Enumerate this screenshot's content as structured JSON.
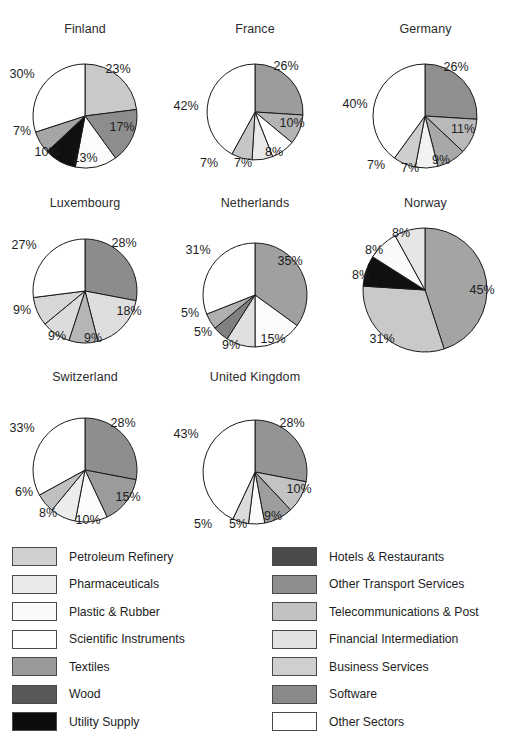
{
  "chart_data": {
    "type": "pie",
    "title": "",
    "subtitle": "",
    "xlabel": "",
    "ylabel": "",
    "legend_position": "bottom",
    "grid": false,
    "value_unit": "%",
    "categories": [
      "Petroleum Refinery",
      "Pharmaceuticals",
      "Plastic & Rubber",
      "Scientific Instruments",
      "Textiles",
      "Wood",
      "Utility Supply",
      "Hotels & Restaurants",
      "Other Transport Services",
      "Telecommunications & Post",
      "Financial Intermediation",
      "Business Services",
      "Software",
      "Other Sectors"
    ],
    "category_colors": [
      "#d0d0d0",
      "#e8e8e8",
      "#fafafa",
      "#ffffff",
      "#9a9a9a",
      "#585858",
      "#0d0d0d",
      "#4a4a4a",
      "#8e8e8e",
      "#c2c2c2",
      "#e2e2e2",
      "#cfcfcf",
      "#8a8a8a",
      "#ffffff"
    ],
    "panels": [
      {
        "name": "Finland",
        "radius": 52,
        "slices": [
          {
            "label": "23%",
            "value": 23,
            "color": "#c9c9c9",
            "label_x": 118,
            "label_y": 69
          },
          {
            "label": "17%",
            "value": 17,
            "color": "#8d8d8d",
            "label_x": 122,
            "label_y": 127
          },
          {
            "label": "13%",
            "value": 13,
            "color": "#fbfbfb",
            "label_x": 85,
            "label_y": 158
          },
          {
            "label": "10%",
            "value": 10,
            "color": "#101010",
            "label_x": 47,
            "label_y": 152
          },
          {
            "label": "7%",
            "value": 7,
            "color": "#a5a5a5",
            "label_x": 22,
            "label_y": 131
          },
          {
            "label": "30%",
            "value": 30,
            "color": "#ffffff",
            "label_x": 22,
            "label_y": 74
          }
        ]
      },
      {
        "name": "France",
        "radius": 48,
        "slices": [
          {
            "label": "26%",
            "value": 26,
            "color": "#9c9c9c",
            "label_x": 286,
            "label_y": 66
          },
          {
            "label": "10%",
            "value": 10,
            "color": "#b4b4b4",
            "label_x": 292,
            "label_y": 123
          },
          {
            "label": "8%",
            "value": 8,
            "color": "#ffffff",
            "label_x": 274,
            "label_y": 152
          },
          {
            "label": "7%",
            "value": 7,
            "color": "#e9e9e9",
            "label_x": 243,
            "label_y": 163
          },
          {
            "label": "7%",
            "value": 7,
            "color": "#c6c6c6",
            "label_x": 209,
            "label_y": 163
          },
          {
            "label": "42%",
            "value": 42,
            "color": "#ffffff",
            "label_x": 186,
            "label_y": 106
          }
        ]
      },
      {
        "name": "Germany",
        "radius": 52,
        "slices": [
          {
            "label": "26%",
            "value": 26,
            "color": "#8f8f8f",
            "label_x": 456,
            "label_y": 67
          },
          {
            "label": "11%",
            "value": 11,
            "color": "#b9b9b9",
            "label_x": 463,
            "label_y": 129
          },
          {
            "label": "9%",
            "value": 9,
            "color": "#a8a8a8",
            "label_x": 441,
            "label_y": 160
          },
          {
            "label": "7%",
            "value": 7,
            "color": "#f2f2f2",
            "label_x": 410,
            "label_y": 168
          },
          {
            "label": "7%",
            "value": 7,
            "color": "#cecece",
            "label_x": 376,
            "label_y": 165
          },
          {
            "label": "40%",
            "value": 40,
            "color": "#ffffff",
            "label_x": 355,
            "label_y": 104
          }
        ]
      },
      {
        "name": "Luxembourg",
        "radius": 52,
        "slices": [
          {
            "label": "28%",
            "value": 28,
            "color": "#8c8c8c",
            "label_x": 124,
            "label_y": 243
          },
          {
            "label": "18%",
            "value": 18,
            "color": "#dedede",
            "label_x": 129,
            "label_y": 311
          },
          {
            "label": "9%",
            "value": 9,
            "color": "#b6b6b6",
            "label_x": 93,
            "label_y": 338
          },
          {
            "label": "9%",
            "value": 9,
            "color": "#dcdcdc",
            "label_x": 57,
            "label_y": 336
          },
          {
            "label": "9%",
            "value": 9,
            "color": "#d7d7d7",
            "label_x": 22,
            "label_y": 310
          },
          {
            "label": "27%",
            "value": 27,
            "color": "#ffffff",
            "label_x": 24,
            "label_y": 245
          }
        ]
      },
      {
        "name": "Netherlands",
        "radius": 52,
        "slices": [
          {
            "label": "35%",
            "value": 35,
            "color": "#a0a0a0",
            "label_x": 290,
            "label_y": 261
          },
          {
            "label": "15%",
            "value": 15,
            "color": "#fbfbfb",
            "label_x": 273,
            "label_y": 339
          },
          {
            "label": "9%",
            "value": 9,
            "color": "#e0e0e0",
            "label_x": 231,
            "label_y": 345
          },
          {
            "label": "5%",
            "value": 5,
            "color": "#808080",
            "label_x": 203,
            "label_y": 332
          },
          {
            "label": "5%",
            "value": 5,
            "color": "#b0b0b0",
            "label_x": 190,
            "label_y": 313
          },
          {
            "label": "31%",
            "value": 31,
            "color": "#ffffff",
            "label_x": 198,
            "label_y": 250
          }
        ]
      },
      {
        "name": "Norway",
        "radius": 62,
        "slices": [
          {
            "label": "45%",
            "value": 45,
            "color": "#a4a4a4",
            "label_x": 482,
            "label_y": 290
          },
          {
            "label": "31%",
            "value": 31,
            "color": "#c9c9c9",
            "label_x": 382,
            "label_y": 339
          },
          {
            "label": "8%",
            "value": 8,
            "color": "#101010",
            "label_x": 361,
            "label_y": 275
          },
          {
            "label": "8%",
            "value": 8,
            "color": "#fafafa",
            "label_x": 374,
            "label_y": 250
          },
          {
            "label": "8%",
            "value": 8,
            "color": "#e6e6e6",
            "label_x": 401,
            "label_y": 233
          }
        ]
      },
      {
        "name": "Switzerland",
        "radius": 52,
        "slices": [
          {
            "label": "28%",
            "value": 28,
            "color": "#8e8e8e",
            "label_x": 123,
            "label_y": 423
          },
          {
            "label": "15%",
            "value": 15,
            "color": "#9b9b9b",
            "label_x": 128,
            "label_y": 497
          },
          {
            "label": "10%",
            "value": 10,
            "color": "#fcfcfc",
            "label_x": 88,
            "label_y": 520
          },
          {
            "label": "8%",
            "value": 8,
            "color": "#ececec",
            "label_x": 48,
            "label_y": 513
          },
          {
            "label": "6%",
            "value": 6,
            "color": "#c0c0c0",
            "label_x": 24,
            "label_y": 492
          },
          {
            "label": "33%",
            "value": 33,
            "color": "#ffffff",
            "label_x": 22,
            "label_y": 428
          }
        ]
      },
      {
        "name": "United Kingdom",
        "radius": 52,
        "slices": [
          {
            "label": "28%",
            "value": 28,
            "color": "#949494",
            "label_x": 292,
            "label_y": 423
          },
          {
            "label": "10%",
            "value": 10,
            "color": "#c3c3c3",
            "label_x": 299,
            "label_y": 489
          },
          {
            "label": "9%",
            "value": 9,
            "color": "#9d9d9d",
            "label_x": 273,
            "label_y": 516
          },
          {
            "label": "5%",
            "value": 5,
            "color": "#fbfbfb",
            "label_x": 238,
            "label_y": 524
          },
          {
            "label": "5%",
            "value": 5,
            "color": "#dcdcdc",
            "label_x": 203,
            "label_y": 524
          },
          {
            "label": "43%",
            "value": 43,
            "color": "#ffffff",
            "label_x": 186,
            "label_y": 434
          }
        ]
      }
    ]
  },
  "legend": {
    "left_column": [
      {
        "label": "Petroleum Refinery",
        "color": "#d0d0d0"
      },
      {
        "label": "Pharmaceuticals",
        "color": "#e9e9e9"
      },
      {
        "label": "Plastic & Rubber",
        "color": "#fafafa"
      },
      {
        "label": "Scientific Instruments",
        "color": "#ffffff"
      },
      {
        "label": "Textiles",
        "color": "#9a9a9a"
      },
      {
        "label": "Wood",
        "color": "#585858"
      },
      {
        "label": "Utility Supply",
        "color": "#0d0d0d"
      }
    ],
    "right_column": [
      {
        "label": "Hotels & Restaurants",
        "color": "#4a4a4a"
      },
      {
        "label": "Other Transport Services",
        "color": "#8e8e8e"
      },
      {
        "label": "Telecommunications & Post",
        "color": "#c2c2c2"
      },
      {
        "label": "Financial Intermediation",
        "color": "#e2e2e2"
      },
      {
        "label": "Business Services",
        "color": "#cfcfcf"
      },
      {
        "label": "Software",
        "color": "#8a8a8a"
      },
      {
        "label": "Other Sectors",
        "color": "#ffffff"
      }
    ]
  },
  "layout": {
    "panel_boxes": [
      {
        "left": 0,
        "top": 22,
        "width": 170,
        "height": 170,
        "cx": 85,
        "cy": 116
      },
      {
        "left": 170,
        "top": 22,
        "width": 170,
        "height": 170,
        "cx": 255,
        "cy": 112
      },
      {
        "left": 340,
        "top": 22,
        "width": 171,
        "height": 170,
        "cx": 425,
        "cy": 116
      },
      {
        "left": 0,
        "top": 196,
        "width": 170,
        "height": 172,
        "cx": 85,
        "cy": 291
      },
      {
        "left": 170,
        "top": 196,
        "width": 170,
        "height": 172,
        "cx": 255,
        "cy": 295
      },
      {
        "left": 340,
        "top": 196,
        "width": 171,
        "height": 172,
        "cx": 425,
        "cy": 290
      },
      {
        "left": 0,
        "top": 370,
        "width": 170,
        "height": 172,
        "cx": 85,
        "cy": 470
      },
      {
        "left": 170,
        "top": 370,
        "width": 170,
        "height": 172,
        "cx": 255,
        "cy": 472
      }
    ]
  }
}
